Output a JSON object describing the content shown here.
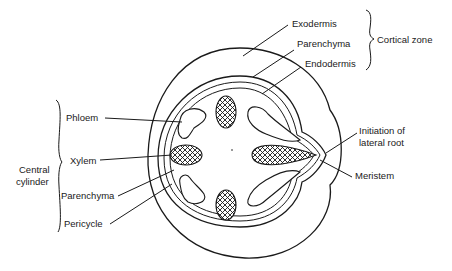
{
  "diagram": {
    "type": "cross-section of root showing lateral root initiation",
    "labels": {
      "exodermis": "Exodermis",
      "parenchyma_cortex": "Parenchyma",
      "endodermis": "Endodermis",
      "cortical_zone": "Cortical zone",
      "phloem": "Phloem",
      "xylem": "Xylem",
      "central": "Central",
      "cylinder": "cylinder",
      "parenchyma_central": "Parenchyma",
      "pericycle": "Pericycle",
      "initiation_line1": "Initiation of",
      "initiation_line2": "lateral root",
      "meristem": "Meristem"
    },
    "groups": {
      "cortical_zone": [
        "Exodermis",
        "Parenchyma",
        "Endodermis"
      ],
      "central_cylinder": [
        "Phloem",
        "Xylem",
        "Parenchyma",
        "Pericycle"
      ]
    },
    "colors": {
      "line": "#1a1a1a",
      "background": "#ffffff"
    }
  }
}
